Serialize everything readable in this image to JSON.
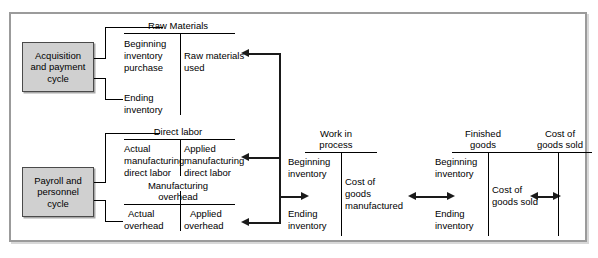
{
  "diagram": {
    "frame_border_color": "#9b9b9b",
    "box_fill_color": "#d0d0d0",
    "line_color": "#000000"
  },
  "cycles": [
    {
      "id": "acquisition",
      "label": "Acquisition\nand payment\ncycle"
    },
    {
      "id": "payroll",
      "label": "Payroll and\npersonnel\ncycle"
    }
  ],
  "accounts": [
    {
      "id": "raw-materials",
      "title": "Raw Materials",
      "debits": [
        "Beginning\ninventory",
        "purchase",
        "Ending\ninventory"
      ],
      "credits": [
        "Raw materials\nused"
      ]
    },
    {
      "id": "direct-labor",
      "title": "Direct labor",
      "debits": [
        "Actual\nmanufacturing\ndirect labor"
      ],
      "credits": [
        "Applied\nmanufacturing\ndirect labor"
      ]
    },
    {
      "id": "manufacturing-overhead",
      "title": "Manufacturing\noverhead",
      "debits": [
        "Actual\noverhead"
      ],
      "credits": [
        "Applied\noverhead"
      ]
    },
    {
      "id": "work-in-process",
      "title": "Work in\nprocess",
      "debits": [
        "Beginning\ninventory",
        "Ending\ninventory"
      ],
      "credits": [
        "Cost of\ngoods\nmanufactured"
      ]
    },
    {
      "id": "finished-goods",
      "title": "Finished\ngoods",
      "debits": [
        "Beginning\ninventory",
        "Ending\ninventory"
      ],
      "credits": [
        "Cost of\ngoods sold"
      ]
    },
    {
      "id": "cost-of-goods-sold",
      "title": "Cost of\ngoods sold",
      "debits": [],
      "credits": []
    }
  ],
  "labels": {
    "raw_materials_title": "Raw Materials",
    "rm_beginning_inventory": "Beginning",
    "rm_inventory_word": "inventory",
    "rm_purchase": "purchase",
    "rm_ending": "Ending",
    "rm_ending_inventory": "inventory",
    "rm_used_line1": "Raw materials",
    "rm_used_line2": "used",
    "direct_labor_title": "Direct labor",
    "dl_actual_1": "Actual",
    "dl_actual_2": "manufacturing",
    "dl_actual_3": "direct labor",
    "dl_applied_1": "Applied",
    "dl_applied_2": "manufacturing",
    "dl_applied_3": "direct labor",
    "moh_title_1": "Manufacturing",
    "moh_title_2": "overhead",
    "moh_actual_1": "Actual",
    "moh_actual_2": "overhead",
    "moh_applied_1": "Applied",
    "moh_applied_2": "overhead",
    "wip_title_1": "Work in",
    "wip_title_2": "process",
    "wip_beg_1": "Beginning",
    "wip_beg_2": "inventory",
    "wip_end_1": "Ending",
    "wip_end_2": "inventory",
    "wip_cgm_1": "Cost of",
    "wip_cgm_2": "goods",
    "wip_cgm_3": "manufactured",
    "fg_title_1": "Finished",
    "fg_title_2": "goods",
    "fg_beg_1": "Beginning",
    "fg_beg_2": "inventory",
    "fg_end_1": "Ending",
    "fg_end_2": "inventory",
    "fg_cgs_1": "Cost of",
    "fg_cgs_2": "goods sold",
    "cgs_title_1": "Cost of",
    "cgs_title_2": "goods sold",
    "acq_1": "Acquisition",
    "acq_2": "and payment",
    "acq_3": "cycle",
    "pay_1": "Payroll and",
    "pay_2": "personnel",
    "pay_3": "cycle"
  }
}
